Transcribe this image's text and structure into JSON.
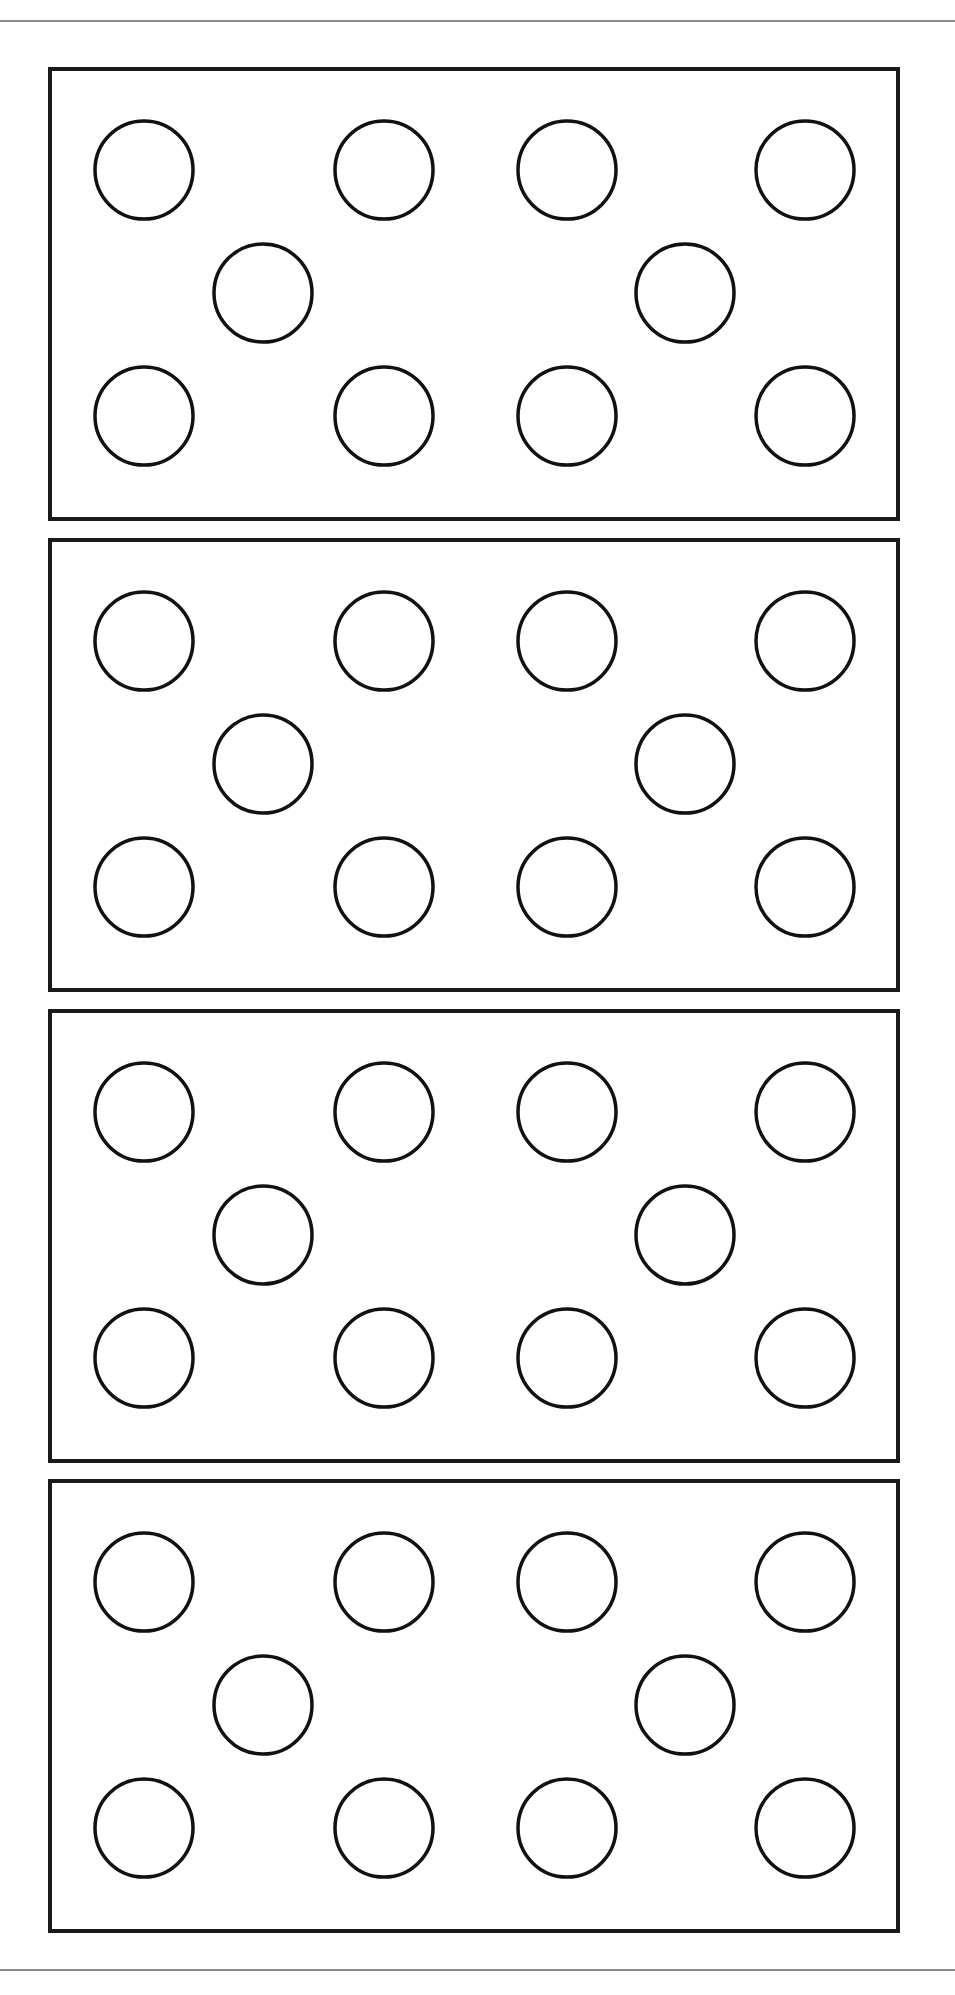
{
  "page": {
    "width": 955,
    "height": 1995,
    "background": "#ffffff",
    "rule_color": "#8a8a8a",
    "stroke_color": "#111111"
  },
  "rules": [
    {
      "name": "top-rule",
      "y": 20
    },
    {
      "name": "bottom-rule",
      "y": 1969
    }
  ],
  "card_layout": {
    "x": 50,
    "width": 848,
    "height": 450,
    "circle_radius": 49,
    "dot_offsets": [
      {
        "dx": 94,
        "dy": 101
      },
      {
        "dx": 334,
        "dy": 101
      },
      {
        "dx": 517,
        "dy": 101
      },
      {
        "dx": 755,
        "dy": 101
      },
      {
        "dx": 213,
        "dy": 224
      },
      {
        "dx": 635,
        "dy": 224
      },
      {
        "dx": 94,
        "dy": 347
      },
      {
        "dx": 334,
        "dy": 347
      },
      {
        "dx": 517,
        "dy": 347
      },
      {
        "dx": 755,
        "dy": 347
      }
    ]
  },
  "cards": [
    {
      "label": "card-1",
      "y": 69,
      "dot_count": 10
    },
    {
      "label": "card-2",
      "y": 540,
      "dot_count": 10
    },
    {
      "label": "card-3",
      "y": 1011,
      "dot_count": 10
    },
    {
      "label": "card-4",
      "y": 1481,
      "dot_count": 10
    }
  ]
}
